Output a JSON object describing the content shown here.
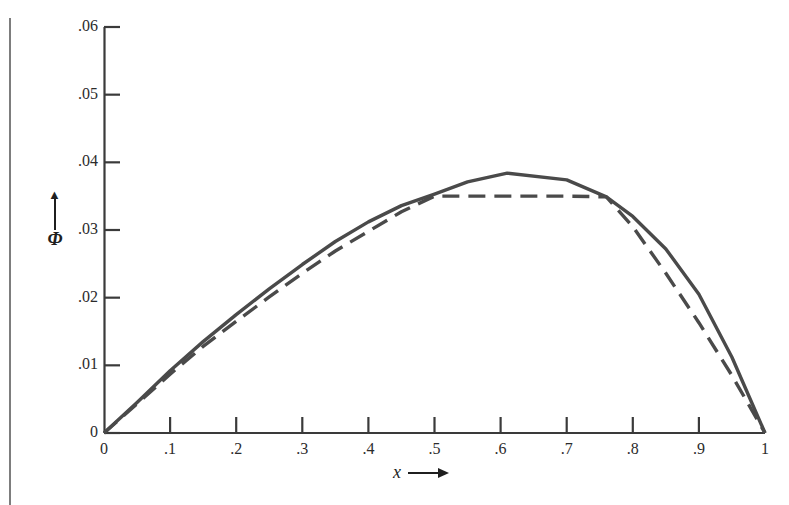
{
  "figure": {
    "background_color": "#ffffff",
    "line_color": "#4a4a4a",
    "axis_color": "#3a3a3a",
    "text_color": "#2b2b2b"
  },
  "axes": {
    "y_title": "Φ",
    "y_arrow": "▲",
    "x_title": "x",
    "x_arrow": "⟶"
  },
  "chart_data": {
    "type": "line",
    "title": "",
    "subtitle": "",
    "xlabel": "x",
    "ylabel": "Φ",
    "xlim": [
      0,
      1
    ],
    "ylim": [
      0,
      0.06
    ],
    "grid": false,
    "legend_position": "none",
    "x_ticks": [
      0,
      0.1,
      0.2,
      0.3,
      0.4,
      0.5,
      0.6,
      0.7,
      0.8,
      0.9,
      1
    ],
    "x_tick_labels": [
      "0",
      ".1",
      ".2",
      ".3",
      ".4",
      ".5",
      ".6",
      ".7",
      ".8",
      ".9",
      "1"
    ],
    "y_ticks": [
      0,
      0.01,
      0.02,
      0.03,
      0.04,
      0.05,
      0.06
    ],
    "y_tick_labels": [
      "0",
      ".01",
      ".02",
      ".03",
      ".04",
      ".05",
      ".06"
    ],
    "series": [
      {
        "name": "solid-curve",
        "style": "solid",
        "color": "#4a4a4a",
        "x": [
          0,
          0.05,
          0.1,
          0.15,
          0.2,
          0.25,
          0.3,
          0.35,
          0.4,
          0.45,
          0.5,
          0.55,
          0.61,
          0.7,
          0.76,
          0.8,
          0.85,
          0.9,
          0.95,
          1
        ],
        "y": [
          0,
          0.0045,
          0.0092,
          0.0135,
          0.0175,
          0.0213,
          0.0249,
          0.0283,
          0.0312,
          0.0336,
          0.0353,
          0.0371,
          0.0384,
          0.0374,
          0.0349,
          0.032,
          0.0272,
          0.0205,
          0.0112,
          0
        ]
      },
      {
        "name": "dashed-curve",
        "style": "dashed",
        "color": "#4a4a4a",
        "x": [
          0,
          0.05,
          0.1,
          0.15,
          0.2,
          0.25,
          0.3,
          0.35,
          0.4,
          0.45,
          0.5,
          0.6,
          0.7,
          0.76,
          0.8,
          0.85,
          0.9,
          0.95,
          1
        ],
        "y": [
          0,
          0.0043,
          0.0087,
          0.0128,
          0.0165,
          0.0201,
          0.0236,
          0.0269,
          0.0298,
          0.0327,
          0.035,
          0.035,
          0.035,
          0.0349,
          0.0305,
          0.0236,
          0.0163,
          0.0085,
          0
        ]
      }
    ]
  }
}
